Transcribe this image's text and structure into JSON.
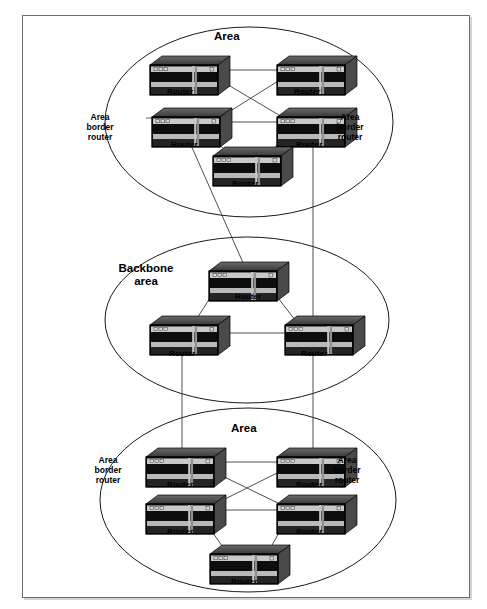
{
  "figure": {
    "kind": "ospf-area-topology-diagram",
    "title_text": "",
    "frame": {
      "border_color": "#6d6d6d",
      "background": "#ffffff"
    }
  },
  "colors": {
    "line": "#3a3a3a",
    "ellipse_stroke": "#1a1a1a",
    "router_top": "#5a5a5a",
    "router_top_dark": "#3d3d3d",
    "router_face_dark": "#121212",
    "router_face_light": "#c9c9c9",
    "router_side": "#4a4a4a",
    "router_outline": "#000000",
    "text": "#000000"
  },
  "areas": [
    {
      "id": "area-top",
      "label": "Area",
      "label_pos": {
        "x": 227,
        "y": 30
      },
      "ellipse": {
        "cx": 249,
        "cy": 122,
        "rx": 144,
        "ry": 95
      }
    },
    {
      "id": "backbone-area",
      "label": "Backbone\narea",
      "label_line1": "Backbone",
      "label_line2": "area",
      "label_pos": {
        "x": 146,
        "y": 262
      },
      "ellipse": {
        "cx": 247,
        "cy": 320,
        "rx": 142,
        "ry": 83
      }
    },
    {
      "id": "area-bottom",
      "label": "Area",
      "label_pos": {
        "x": 244,
        "y": 422
      },
      "ellipse": {
        "cx": 248,
        "cy": 500,
        "rx": 148,
        "ry": 92
      }
    }
  ],
  "abr_labels": [
    {
      "id": "abr-top-left",
      "text": "Area border router",
      "lines": [
        "Area",
        "border",
        "router"
      ],
      "x": 100,
      "y": 112
    },
    {
      "id": "abr-top-right",
      "text": "Area border router",
      "lines": [
        "Area",
        "border",
        "router"
      ],
      "x": 350,
      "y": 112
    },
    {
      "id": "abr-bottom-left",
      "text": "Area border router",
      "lines": [
        "Area",
        "border",
        "router"
      ],
      "x": 108,
      "y": 455
    },
    {
      "id": "abr-bottom-right",
      "text": "Area border router",
      "lines": [
        "Area",
        "border",
        "router"
      ],
      "x": 347,
      "y": 455
    }
  ],
  "router_label": "Router",
  "routers": [
    {
      "id": "r-top-1",
      "area": "area-top",
      "x": 150,
      "y": 56,
      "w": 68,
      "h": 30,
      "label": "Router",
      "label_x": 180,
      "label_y": 88,
      "is_abr": false
    },
    {
      "id": "r-top-2",
      "area": "area-top",
      "x": 277,
      "y": 56,
      "w": 68,
      "h": 30,
      "label": "Router",
      "label_x": 307,
      "label_y": 88,
      "is_abr": false
    },
    {
      "id": "r-top-3",
      "area": "area-top",
      "x": 152,
      "y": 108,
      "w": 68,
      "h": 30,
      "label": "Router",
      "label_x": 184,
      "label_y": 141,
      "is_abr": true
    },
    {
      "id": "r-top-4",
      "area": "area-top",
      "x": 277,
      "y": 108,
      "w": 68,
      "h": 30,
      "label": "Router",
      "label_x": 309,
      "label_y": 141,
      "is_abr": true
    },
    {
      "id": "r-top-5",
      "area": "area-top",
      "x": 213,
      "y": 147,
      "w": 68,
      "h": 30,
      "label": "Router",
      "label_x": 245,
      "label_y": 180,
      "is_abr": false
    },
    {
      "id": "r-bb-1",
      "area": "backbone-area",
      "x": 209,
      "y": 262,
      "w": 68,
      "h": 30,
      "label": "Router",
      "label_x": 248,
      "label_y": 293,
      "is_abr": false
    },
    {
      "id": "r-bb-2",
      "area": "backbone-area",
      "x": 150,
      "y": 316,
      "w": 68,
      "h": 30,
      "label": "Router",
      "label_x": 182,
      "label_y": 350,
      "is_abr": false
    },
    {
      "id": "r-bb-3",
      "area": "backbone-area",
      "x": 285,
      "y": 316,
      "w": 68,
      "h": 30,
      "label": "Router",
      "label_x": 314,
      "label_y": 350,
      "is_abr": false
    },
    {
      "id": "r-bot-1",
      "area": "area-bottom",
      "x": 146,
      "y": 448,
      "w": 68,
      "h": 30,
      "label": "Router",
      "label_x": 180,
      "label_y": 481,
      "is_abr": true
    },
    {
      "id": "r-bot-2",
      "area": "area-bottom",
      "x": 277,
      "y": 448,
      "w": 68,
      "h": 30,
      "label": "Router",
      "label_x": 309,
      "label_y": 481,
      "is_abr": true
    },
    {
      "id": "r-bot-3",
      "area": "area-bottom",
      "x": 146,
      "y": 495,
      "w": 68,
      "h": 30,
      "label": "Router",
      "label_x": 180,
      "label_y": 528,
      "is_abr": false
    },
    {
      "id": "r-bot-4",
      "area": "area-bottom",
      "x": 277,
      "y": 495,
      "w": 68,
      "h": 30,
      "label": "Router",
      "label_x": 309,
      "label_y": 528,
      "is_abr": false
    },
    {
      "id": "r-bot-5",
      "area": "area-bottom",
      "x": 210,
      "y": 545,
      "w": 68,
      "h": 30,
      "label": "Router",
      "label_x": 244,
      "label_y": 578,
      "is_abr": false
    }
  ],
  "links": [
    {
      "id": "l-top-a",
      "from": "r-top-1",
      "to": "r-top-2",
      "x1": 218,
      "y1": 70,
      "x2": 284,
      "y2": 70,
      "kind": "intra-area"
    },
    {
      "id": "l-top-b",
      "from": "r-top-1",
      "to": "r-top-4",
      "x1": 213,
      "y1": 76,
      "x2": 284,
      "y2": 118,
      "kind": "intra-area"
    },
    {
      "id": "l-top-c",
      "from": "r-top-2",
      "to": "r-top-3",
      "x1": 283,
      "y1": 78,
      "x2": 216,
      "y2": 120,
      "kind": "intra-area"
    },
    {
      "id": "l-top-d",
      "from": "r-top-3",
      "to": "r-top-4",
      "x1": 220,
      "y1": 122,
      "x2": 284,
      "y2": 122,
      "kind": "intra-area"
    },
    {
      "id": "l-top-e",
      "from": "r-top-3",
      "to": "r-top-5",
      "x1": 208,
      "y1": 132,
      "x2": 232,
      "y2": 158,
      "kind": "intra-area"
    },
    {
      "id": "l-top-f",
      "from": "r-top-4",
      "to": "r-top-5",
      "x1": 287,
      "y1": 132,
      "x2": 267,
      "y2": 158,
      "kind": "intra-area"
    },
    {
      "id": "l-inter-1",
      "from": "r-top-3",
      "to": "r-bb-1",
      "x1": 190,
      "y1": 143,
      "x2": 244,
      "y2": 265,
      "kind": "inter-area"
    },
    {
      "id": "l-inter-2",
      "from": "r-top-4",
      "to": "r-bb-3",
      "x1": 313,
      "y1": 144,
      "x2": 313,
      "y2": 320,
      "kind": "inter-area"
    },
    {
      "id": "l-bb-a",
      "from": "r-bb-1",
      "to": "r-bb-2",
      "x1": 215,
      "y1": 290,
      "x2": 196,
      "y2": 320,
      "kind": "intra-area"
    },
    {
      "id": "l-bb-b",
      "from": "r-bb-1",
      "to": "r-bb-3",
      "x1": 272,
      "y1": 290,
      "x2": 295,
      "y2": 320,
      "kind": "intra-area"
    },
    {
      "id": "l-bb-c",
      "from": "r-bb-2",
      "to": "r-bb-3",
      "x1": 218,
      "y1": 333,
      "x2": 285,
      "y2": 333,
      "kind": "intra-area"
    },
    {
      "id": "l-inter-3",
      "from": "r-bb-2",
      "to": "r-bot-1",
      "x1": 182,
      "y1": 346,
      "x2": 182,
      "y2": 452,
      "kind": "inter-area"
    },
    {
      "id": "l-inter-4",
      "from": "r-bb-3",
      "to": "r-bot-2",
      "x1": 313,
      "y1": 346,
      "x2": 313,
      "y2": 452,
      "kind": "inter-area"
    },
    {
      "id": "l-bot-a",
      "from": "r-bot-1",
      "to": "r-bot-2",
      "x1": 214,
      "y1": 462,
      "x2": 284,
      "y2": 462,
      "kind": "intra-area"
    },
    {
      "id": "l-bot-b",
      "from": "r-bot-1",
      "to": "r-bot-4",
      "x1": 210,
      "y1": 470,
      "x2": 284,
      "y2": 506,
      "kind": "intra-area"
    },
    {
      "id": "l-bot-c",
      "from": "r-bot-2",
      "to": "r-bot-3",
      "x1": 283,
      "y1": 470,
      "x2": 211,
      "y2": 506,
      "kind": "intra-area"
    },
    {
      "id": "l-bot-d",
      "from": "r-bot-3",
      "to": "r-bot-4",
      "x1": 214,
      "y1": 510,
      "x2": 284,
      "y2": 510,
      "kind": "intra-area"
    },
    {
      "id": "l-bot-e",
      "from": "r-bot-3",
      "to": "r-bot-5",
      "x1": 204,
      "y1": 520,
      "x2": 229,
      "y2": 556,
      "kind": "intra-area"
    },
    {
      "id": "l-bot-f",
      "from": "r-bot-4",
      "to": "r-bot-5",
      "x1": 286,
      "y1": 520,
      "x2": 266,
      "y2": 556,
      "kind": "intra-area"
    },
    {
      "id": "l-abr-lead-tl",
      "from": "abr-top-left",
      "to": "r-top-3",
      "x1": 146,
      "y1": 118,
      "x2": 154,
      "y2": 118,
      "kind": "leader"
    },
    {
      "id": "l-abr-lead-tr",
      "from": "abr-top-right",
      "to": "r-top-4",
      "x1": 346,
      "y1": 118,
      "x2": 344,
      "y2": 118,
      "kind": "leader"
    }
  ]
}
